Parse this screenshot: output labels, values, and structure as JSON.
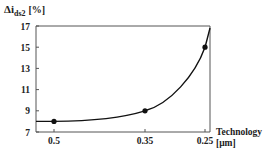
{
  "chart_data": {
    "type": "line",
    "title": "",
    "ylabel": "Δi",
    "ylabel_sub": "ds2",
    "ylabel_unit": "[%]",
    "xlabel_line1": "Technology",
    "xlabel_line2": "[μm]",
    "ylim": [
      7,
      17
    ],
    "yticks": [
      7,
      9,
      11,
      13,
      15,
      17
    ],
    "xticks": [
      "0.5",
      "0.35",
      "0.25"
    ],
    "x_reversed": true,
    "grid": false,
    "legend": "none",
    "series": [
      {
        "name": "Δids2",
        "x": [
          0.5,
          0.35,
          0.25
        ],
        "values": [
          8,
          9,
          15
        ],
        "marker": "circle",
        "color": "#111111"
      }
    ]
  },
  "colors": {
    "line": "#111111",
    "axis": "#555555"
  }
}
